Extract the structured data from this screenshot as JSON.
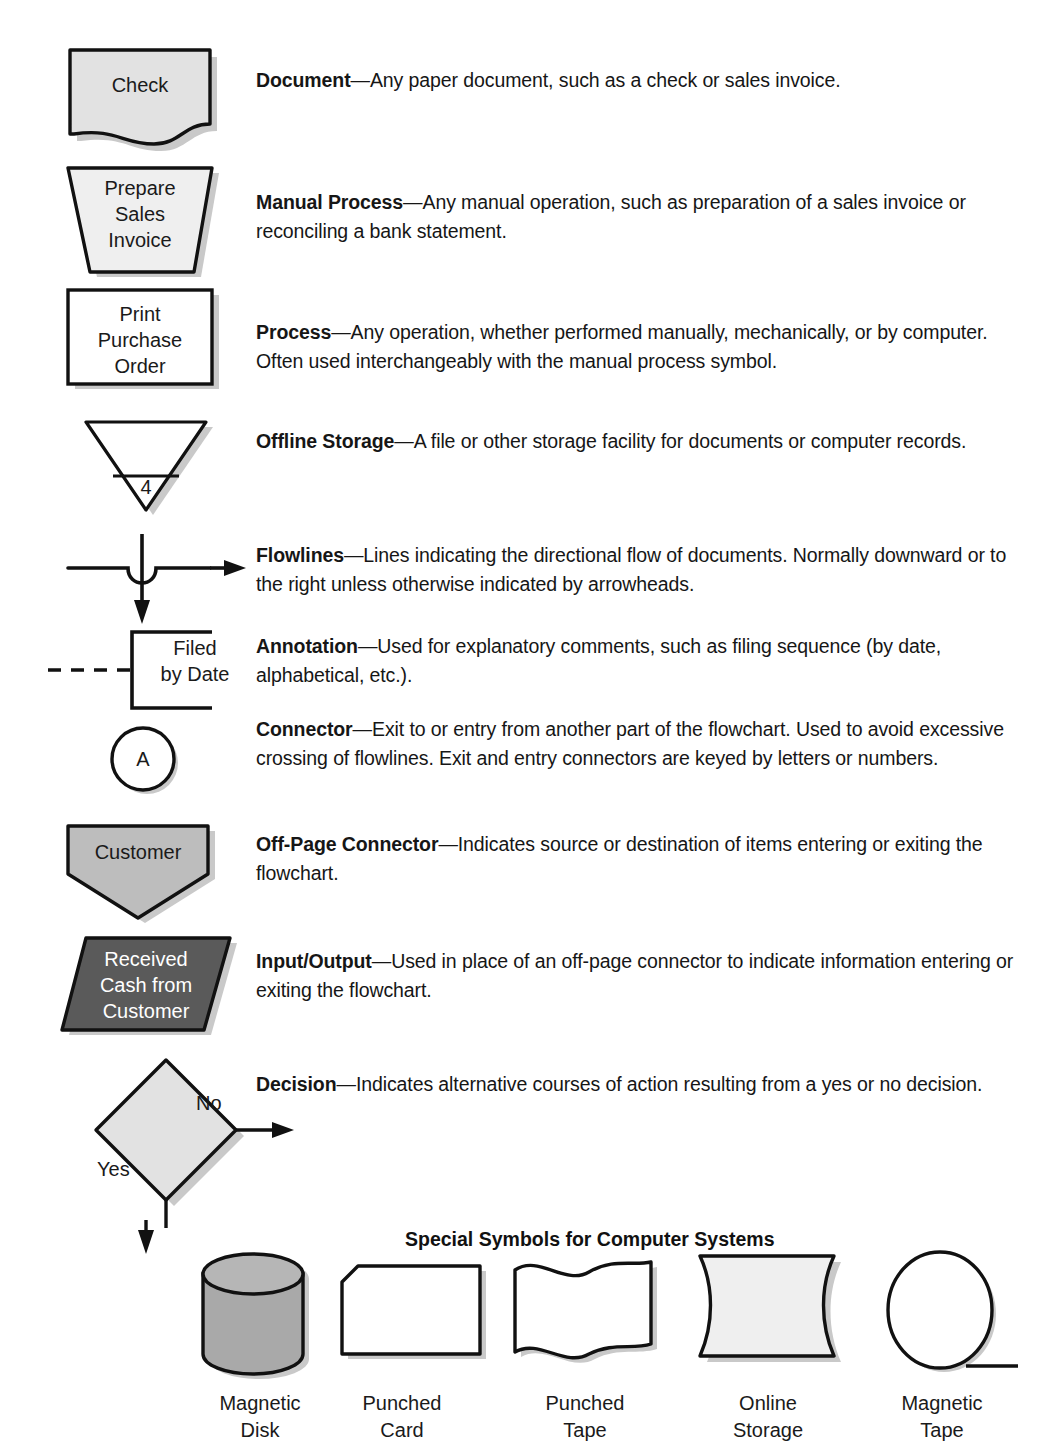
{
  "rows": [
    {
      "id": "document",
      "symbol_text": "Check",
      "term": "Document",
      "dash": "—",
      "body": "Any paper document, such as a check or sales invoice."
    },
    {
      "id": "manual-process",
      "symbol_text": "Prepare\nSales\nInvoice",
      "term": "Manual Process",
      "dash": "—",
      "body": "Any manual operation, such as preparation of a sales invoice or reconciling a bank statement."
    },
    {
      "id": "process",
      "symbol_text": "Print\nPurchase\nOrder",
      "term": "Process",
      "dash": "—",
      "body": "Any operation, whether performed manually, mechanically, or by computer. Often used interchangeably with the manual process symbol."
    },
    {
      "id": "offline-storage",
      "symbol_text": "4",
      "term": "Offline Storage",
      "dash": "—",
      "body": "A file or other storage facility for documents or computer records."
    },
    {
      "id": "flowlines",
      "symbol_text": "",
      "term": "Flowlines",
      "dash": "—",
      "body": "Lines indicating the directional flow of documents. Normally downward or to the right unless otherwise indicated by arrowheads."
    },
    {
      "id": "annotation",
      "symbol_text": "Filed\nby Date",
      "term": "Annotation",
      "dash": "—",
      "body": "Used for explanatory comments, such as filing sequence (by date, alphabetical, etc.)."
    },
    {
      "id": "connector",
      "symbol_text": "A",
      "term": "Connector",
      "dash": "—",
      "body": "Exit to or entry from another part of the flowchart. Used to avoid excessive crossing of flowlines. Exit and entry connectors are keyed by letters or numbers."
    },
    {
      "id": "off-page-connector",
      "symbol_text": "Customer",
      "term": "Off-Page Connector",
      "dash": "—",
      "body": "Indicates source or destination of items entering or exiting the flowchart."
    },
    {
      "id": "input-output",
      "symbol_text": "Received\nCash from\nCustomer",
      "term": "Input/Output",
      "dash": "—",
      "body": "Used in place of an off-page connector to indicate information entering or exiting the flowchart."
    },
    {
      "id": "decision",
      "symbol_text": "",
      "term": "Decision",
      "dash": "—",
      "body": "Indicates alternative courses of action resulting from a yes or no decision."
    }
  ],
  "decision_labels": {
    "no": "No",
    "yes": "Yes"
  },
  "special": {
    "title": "Special Symbols for Computer Systems",
    "items": [
      {
        "id": "magnetic-disk",
        "caption": "Magnetic\nDisk"
      },
      {
        "id": "punched-card",
        "caption": "Punched\nCard"
      },
      {
        "id": "punched-tape",
        "caption": "Punched\nTape"
      },
      {
        "id": "online-storage",
        "caption": "Online\nStorage"
      },
      {
        "id": "magnetic-tape",
        "caption": "Magnetic\nTape"
      }
    ]
  },
  "colors": {
    "fill_light": "#e2e2e2",
    "fill_medium": "#b4b4b4",
    "fill_dark": "#5a5a5a",
    "fill_pale": "#efefef",
    "stroke": "#111111",
    "shadow": "#c9c9c9",
    "text": "#1a1a1a",
    "text_light": "#ffffff"
  }
}
